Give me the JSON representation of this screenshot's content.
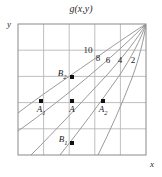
{
  "figure": {
    "title": "g(x,y)",
    "axes": {
      "x_label": "x",
      "y_label": "y"
    }
  },
  "chart_data": {
    "type": "line",
    "subtype": "contour-plot",
    "title": "g(x,y)",
    "xlabel": "x",
    "ylabel": "y",
    "grid": true,
    "grid_columns": 5,
    "grid_rows": 5,
    "xlim": [
      0,
      5
    ],
    "ylim": [
      0,
      5
    ],
    "legend_position": "none",
    "contour_labels": [
      "10",
      "8",
      "6",
      "4",
      "2"
    ],
    "contour_levels": [
      10,
      8,
      6,
      4,
      2
    ],
    "contours": [
      {
        "level": 10,
        "label": "10",
        "label_x": 88,
        "label_y": 50,
        "path": "M 18,113 C 40,96 64,80 90,62 C 110,48 130,34 146,24"
      },
      {
        "level": 8,
        "label": "8",
        "label_x": 98,
        "label_y": 58,
        "path": "M 18,131 C 42,114 68,94 96,70 C 116,53 134,36 146,24"
      },
      {
        "level": 6,
        "label": "6",
        "label_x": 108,
        "label_y": 60,
        "path": "M 31,155 C 55,131 80,104 106,76 C 123,57 138,38 146,24"
      },
      {
        "level": 4,
        "label": "4",
        "label_x": 120,
        "label_y": 60,
        "path": "M 60,155 C 80,130 100,103 119,76 C 131,58 141,39 146,24"
      },
      {
        "level": 2,
        "label": "2",
        "label_x": 133,
        "label_y": 60,
        "path": "M 98,155 C 110,131 122,104 132,78 C 139,59 144,39 146,24"
      }
    ],
    "points": [
      {
        "name": "A1",
        "label": "A",
        "subscript": "1",
        "x": 41,
        "y": 101,
        "label_x": 41,
        "label_y": 104
      },
      {
        "name": "A",
        "label": "A",
        "subscript": "",
        "x": 72,
        "y": 101,
        "label_x": 72,
        "label_y": 104
      },
      {
        "name": "A2",
        "label": "A",
        "subscript": "2",
        "x": 103,
        "y": 101,
        "label_x": 103,
        "label_y": 104
      },
      {
        "name": "B2",
        "label": "B",
        "subscript": "2",
        "x": 72,
        "y": 77,
        "label_x": 62,
        "label_y": 68
      },
      {
        "name": "B1",
        "label": "B",
        "subscript": "1",
        "x": 72,
        "y": 143,
        "label_x": 63,
        "label_y": 134
      }
    ],
    "colors": {
      "contour_line": "#9a9a9a",
      "grid_line": "#b8b8b8",
      "frame": "#8a8a8a",
      "point_marker": "#111111",
      "text": "#1a1a1a",
      "background": "#ffffff"
    }
  }
}
